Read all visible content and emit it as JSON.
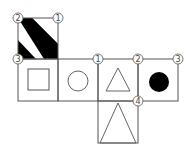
{
  "diagram": {
    "type": "cube-net",
    "faces": [
      {
        "id": "top",
        "symbol": "diagonal-stripes",
        "fill": "#000000"
      },
      {
        "id": "left",
        "symbol": "square-outline"
      },
      {
        "id": "center-left",
        "symbol": "circle-outline"
      },
      {
        "id": "center",
        "symbol": "triangle-outline"
      },
      {
        "id": "right",
        "symbol": "filled-circle",
        "fill": "#000000"
      },
      {
        "id": "bottom",
        "symbol": "tall-triangle-outline"
      }
    ],
    "vertex_labels": [
      {
        "text": "2",
        "position": "top-face-top-left"
      },
      {
        "text": "1",
        "position": "top-face-top-right"
      },
      {
        "text": "3",
        "position": "row-top-left"
      },
      {
        "text": "1",
        "position": "center-face-top-left"
      },
      {
        "text": "2",
        "position": "right-face-top-left"
      },
      {
        "text": "3",
        "position": "right-face-top-right"
      },
      {
        "text": "4",
        "position": "right-face-bottom-left"
      }
    ],
    "line_color": "#555555"
  }
}
